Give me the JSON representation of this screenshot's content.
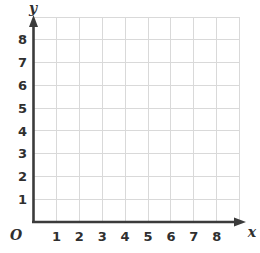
{
  "chart_data": {
    "type": "scatter",
    "title": "",
    "subtitle": "",
    "xlabel": "x",
    "ylabel": "y",
    "origin_label": "O",
    "x_ticks": [
      "1",
      "2",
      "3",
      "4",
      "5",
      "6",
      "7",
      "8"
    ],
    "y_ticks": [
      "1",
      "2",
      "3",
      "4",
      "5",
      "6",
      "7",
      "8"
    ],
    "xlim": [
      0,
      9
    ],
    "ylim": [
      0,
      9
    ],
    "series": [
      {
        "name": "",
        "x": [],
        "y": []
      }
    ],
    "annotations": [],
    "grid": "on",
    "legend": "none"
  },
  "figure": {
    "axis_color": "#3b3b3b",
    "grid_color": "#d9d9d9",
    "background_color": "#ffffff",
    "tick_label_color": "#2f2f2f"
  }
}
